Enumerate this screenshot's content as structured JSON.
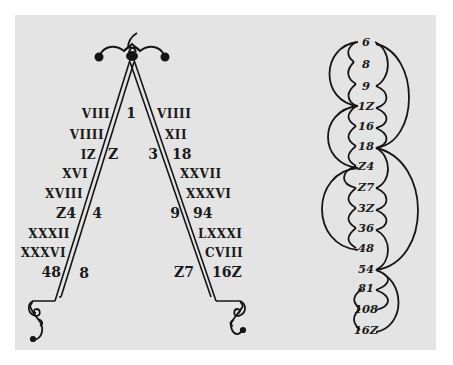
{
  "figure": {
    "type": "lambdoma-woodcut",
    "background_color": "#e4e4e4",
    "ink_color": "#151515"
  },
  "lambda": {
    "apex_ornament": "winged-finial-icon",
    "feet_ornament": "scroll-foot-icon",
    "left_leg_roman": [
      "VIII",
      "VIIII",
      "IZ",
      "XVI",
      "XVIII",
      "Z4",
      "XXXII",
      "XXXVI",
      "48"
    ],
    "right_leg_roman": [
      "VIIII",
      "XII",
      "18",
      "XXVII",
      "XXXVI",
      "94",
      "LXXXI",
      "CVIII",
      "162"
    ],
    "inner_left": [
      "1",
      "Z",
      "4",
      "8"
    ],
    "inner_right": [
      "3",
      "9",
      "Z7"
    ],
    "labels": {
      "l0": "VIII",
      "l1": "VIIII",
      "l2": "IZ",
      "l3": "XVI",
      "l4": "XVIII",
      "l5": "Z4",
      "l6": "XXXII",
      "l7": "XXXVI",
      "l8": "48",
      "r0": "VIIII",
      "r1": "XII",
      "r2": "18",
      "r3": "XXVII",
      "r4": "XXXVI",
      "r5": "94",
      "r6": "LXXXI",
      "r7": "CVIII",
      "r8": "16Z",
      "apex": "1",
      "i2": "Z",
      "i3": "3",
      "i4": "4",
      "i9": "9",
      "i8": "8",
      "i27": "Z7"
    }
  },
  "series_column": {
    "values": [
      "6",
      "8",
      "9",
      "1Z",
      "16",
      "18",
      "Z4",
      "Z7",
      "3Z",
      "36",
      "48",
      "54",
      "81",
      "108",
      "16Z"
    ],
    "arcs_description": "Nested arcs linking the values in harmonic/arithmetic groupings: small arcs between successive terms, larger arcs 6–12, 6–18, 12–24, 18–54, 24–48, 54–162"
  }
}
